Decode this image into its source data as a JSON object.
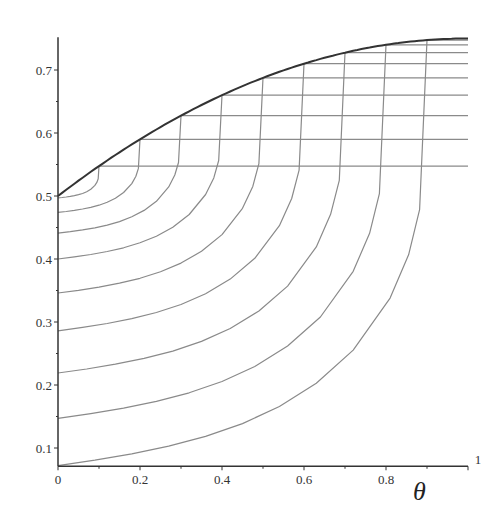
{
  "chart_data": {
    "type": "line",
    "title": "",
    "xlabel": "θ",
    "ylabel": "",
    "xlim": [
      0,
      1
    ],
    "ylim": [
      0.071,
      0.752
    ],
    "grid": false,
    "legend": "none",
    "x_ticks": [
      {
        "value": 0,
        "label": "0"
      },
      {
        "value": 0.2,
        "label": "0.2"
      },
      {
        "value": 0.4,
        "label": "0.4"
      },
      {
        "value": 0.6,
        "label": "0.6"
      },
      {
        "value": 0.8,
        "label": "0.8"
      },
      {
        "value": 1,
        "label": "1"
      }
    ],
    "x_minor_ticks": [
      0.1,
      0.3,
      0.5,
      0.7,
      0.9
    ],
    "y_ticks": [
      {
        "value": 0.1,
        "label": "0.1"
      },
      {
        "value": 0.2,
        "label": "0.2"
      },
      {
        "value": 0.3,
        "label": "0.3"
      },
      {
        "value": 0.4,
        "label": "0.4"
      },
      {
        "value": 0.5,
        "label": "0.5"
      },
      {
        "value": 0.6,
        "label": "0.6"
      },
      {
        "value": 0.7,
        "label": "0.7"
      }
    ],
    "y_minor_ticks": [
      0.15,
      0.25,
      0.35,
      0.45,
      0.55,
      0.65
    ],
    "envelope": {
      "name": "envelope",
      "description": "upper boundary curve, y = 0.5 + 0.25*(1-(1-θ)^2)",
      "x": [
        0,
        0.1,
        0.2,
        0.3,
        0.4,
        0.5,
        0.6,
        0.7,
        0.8,
        0.9,
        1.0
      ],
      "y": [
        0.5,
        0.5475,
        0.59,
        0.6275,
        0.66,
        0.6875,
        0.71,
        0.7275,
        0.74,
        0.7475,
        0.75
      ],
      "color": "#333333"
    },
    "horizontal_lines": [
      {
        "y": 0.5475,
        "x_start": 0.1,
        "x_end": 1
      },
      {
        "y": 0.59,
        "x_start": 0.2,
        "x_end": 1
      },
      {
        "y": 0.6275,
        "x_start": 0.3,
        "x_end": 1
      },
      {
        "y": 0.66,
        "x_start": 0.4,
        "x_end": 1
      },
      {
        "y": 0.6875,
        "x_start": 0.5,
        "x_end": 1
      },
      {
        "y": 0.71,
        "x_start": 0.6,
        "x_end": 1
      },
      {
        "y": 0.7275,
        "x_start": 0.7,
        "x_end": 1
      },
      {
        "y": 0.74,
        "x_start": 0.8,
        "x_end": 1
      },
      {
        "y": 0.7475,
        "x_start": 0.9,
        "x_end": 1
      }
    ],
    "rising_curves": [
      {
        "y0": 0.497,
        "x_end": 0.1
      },
      {
        "y0": 0.474,
        "x_end": 0.2
      },
      {
        "y0": 0.441,
        "x_end": 0.3
      },
      {
        "y0": 0.4,
        "x_end": 0.4
      },
      {
        "y0": 0.346,
        "x_end": 0.5
      },
      {
        "y0": 0.286,
        "x_end": 0.6
      },
      {
        "y0": 0.219,
        "x_end": 0.7
      },
      {
        "y0": 0.147,
        "x_end": 0.8
      },
      {
        "y0": 0.072,
        "x_end": 0.9
      }
    ],
    "curve_shape": {
      "s": [
        0,
        0.1,
        0.2,
        0.3,
        0.4,
        0.5,
        0.6,
        0.7,
        0.8,
        0.9,
        0.95,
        0.98,
        1.0
      ],
      "remaining_fraction": [
        1,
        0.9873,
        0.9725,
        0.9544,
        0.9314,
        0.9013,
        0.861,
        0.8063,
        0.7286,
        0.6064,
        0.5046,
        0.3985,
        0
      ]
    },
    "line_color": "#8a8a8a",
    "axis_color": "#333333"
  }
}
